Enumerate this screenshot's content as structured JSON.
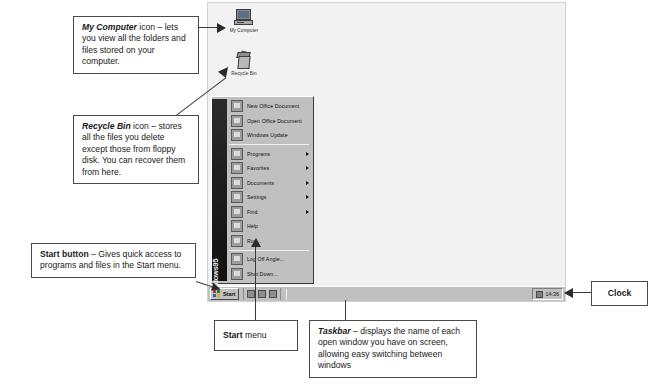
{
  "desktop": {
    "icons": [
      {
        "name": "my-computer",
        "label": "My Computer"
      },
      {
        "name": "recycle-bin",
        "label": "Recycle Bin"
      }
    ],
    "start_menu": {
      "banner_text": "Windows95",
      "groups": [
        {
          "items": [
            {
              "label": "New Office Document",
              "submenu": false
            },
            {
              "label": "Open Office Document",
              "submenu": false
            },
            {
              "label": "Windows Update",
              "submenu": false
            }
          ]
        },
        {
          "items": [
            {
              "label": "Programs",
              "submenu": true
            },
            {
              "label": "Favorites",
              "submenu": true
            },
            {
              "label": "Documents",
              "submenu": true
            },
            {
              "label": "Settings",
              "submenu": true
            },
            {
              "label": "Find",
              "submenu": true
            },
            {
              "label": "Help",
              "submenu": false
            },
            {
              "label": "Run...",
              "submenu": false
            }
          ]
        },
        {
          "items": [
            {
              "label": "Log Off Angie...",
              "submenu": false
            },
            {
              "label": "Shut Down...",
              "submenu": false
            }
          ]
        }
      ]
    },
    "taskbar": {
      "start_label": "Start",
      "quick_launch_count": 3,
      "clock": "14:36"
    }
  },
  "callouts": {
    "my_computer": {
      "term": "My Computer",
      "rest": " icon – lets you view all the folders and files stored on your computer."
    },
    "recycle_bin": {
      "term": "Recycle Bin",
      "rest": " icon – stores all the files you delete except those from floppy disk. You can recover them from here."
    },
    "start_button": {
      "term": "Start button",
      "rest": " – Gives quick access to programs and files in the Start menu."
    },
    "start_menu": {
      "term": "Start",
      "rest": " menu"
    },
    "taskbar": {
      "term": "Taskbar",
      "rest": " – displays the name of each open window you have on screen, allowing easy switching between windows"
    },
    "clock": {
      "term": "Clock",
      "rest": ""
    }
  },
  "colors": {
    "desktop_bg": "#f2f2f2",
    "chrome": "#c0c0c0",
    "ink": "#1a1a1a",
    "leader": "#3a3a3a"
  }
}
